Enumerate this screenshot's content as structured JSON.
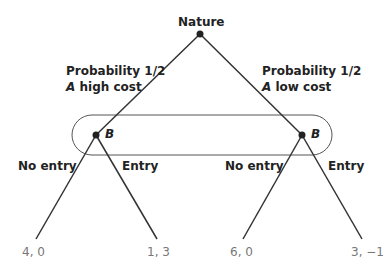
{
  "diagram": {
    "type": "game-tree",
    "root": {
      "label": "Nature",
      "x": 200,
      "y": 34
    },
    "branches": [
      {
        "side": "left",
        "probability_label": "Probability 1/2",
        "type_label_italic": "A",
        "type_label_rest": " high cost",
        "node_label": "B",
        "node": {
          "x": 96,
          "y": 135
        },
        "actions": [
          {
            "label": "No entry",
            "payoff": "4, 0",
            "end": {
              "x": 36,
              "y": 239
            }
          },
          {
            "label": "Entry",
            "payoff": "1, 3",
            "end": {
              "x": 157,
              "y": 239
            }
          }
        ]
      },
      {
        "side": "right",
        "probability_label": "Probability 1/2",
        "type_label_italic": "A",
        "type_label_rest": " low cost",
        "node_label": "B",
        "node": {
          "x": 302,
          "y": 135
        },
        "actions": [
          {
            "label": "No entry",
            "payoff": "6, 0",
            "end": {
              "x": 243,
              "y": 239
            }
          },
          {
            "label": "Entry",
            "payoff": "3, −1",
            "end": {
              "x": 362,
              "y": 239
            }
          }
        ]
      }
    ],
    "information_set": {
      "shape": "rounded-rectangle",
      "x": 72,
      "y": 115,
      "width": 260,
      "height": 40,
      "radius": 20
    },
    "colors": {
      "line": "#333333",
      "oval": "#555555",
      "text": "#222222",
      "payoff_text": "#777777"
    }
  }
}
